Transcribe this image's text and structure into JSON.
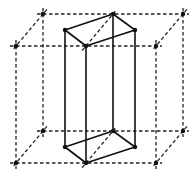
{
  "diagram": {
    "colors": {
      "line": "#111111",
      "background": "#ffffff"
    },
    "outer_cube": {
      "style": "dashed",
      "vertices": {
        "back_top_left": [
          43,
          14
        ],
        "back_top_right": [
          183,
          14
        ],
        "front_top_left": [
          16,
          46
        ],
        "front_top_right": [
          156,
          46
        ],
        "back_bottom_left": [
          43,
          131
        ],
        "back_bottom_right": [
          183,
          131
        ],
        "front_bottom_left": [
          16,
          163
        ],
        "front_bottom_right": [
          156,
          163
        ]
      }
    },
    "inner_prism": {
      "style": "solid",
      "vertices": {
        "top_left": [
          65,
          30
        ],
        "top_back": [
          113,
          14
        ],
        "top_right": [
          135,
          30
        ],
        "top_front": [
          86,
          46
        ],
        "bottom_left": [
          65,
          147
        ],
        "bottom_back": [
          113,
          131
        ],
        "bottom_right": [
          135,
          147
        ],
        "bottom_front": [
          86,
          163
        ]
      }
    }
  }
}
